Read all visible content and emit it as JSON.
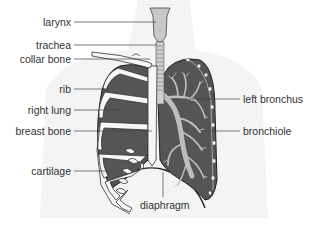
{
  "diagram": {
    "colors": {
      "background": "#ffffff",
      "body_silhouette": "#f3f3f3",
      "lung_fill": "#555555",
      "bone": "#f7f7f7",
      "outline": "#333333",
      "airway": "#bdbdbd",
      "leader_line": "#444444",
      "text": "#333333"
    },
    "labels": {
      "left_side": [
        {
          "id": "larynx",
          "text": "larynx"
        },
        {
          "id": "trachea",
          "text": "trachea"
        },
        {
          "id": "collar_bone",
          "text": "collar bone"
        },
        {
          "id": "rib",
          "text": "rib"
        },
        {
          "id": "right_lung",
          "text": "right lung"
        },
        {
          "id": "breast_bone",
          "text": "breast bone"
        },
        {
          "id": "cartilage",
          "text": "cartilage"
        }
      ],
      "right_side": [
        {
          "id": "left_bronchus",
          "text": "left bronchus"
        },
        {
          "id": "bronchiole",
          "text": "bronchiole"
        }
      ],
      "bottom": [
        {
          "id": "diaphragm",
          "text": "diaphragm"
        }
      ]
    }
  }
}
